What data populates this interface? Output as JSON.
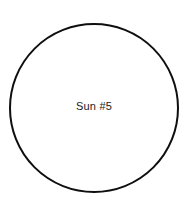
{
  "canvas": {
    "width": 191,
    "height": 221,
    "background_color": "#ffffff"
  },
  "diagram": {
    "type": "node-diagram",
    "title": "Sun #5",
    "shapes": [
      {
        "id": "sun-circle",
        "kind": "circle",
        "label": "Sun #5",
        "center_x": 94,
        "center_y": 108,
        "radius": 84,
        "stroke_color": "#0f0f0f",
        "stroke_width": 2,
        "fill_color": "#ffffff",
        "label_x": 94,
        "label_y": 107,
        "label_color": "#1a1a1a",
        "label_font_size": 11
      }
    ]
  }
}
